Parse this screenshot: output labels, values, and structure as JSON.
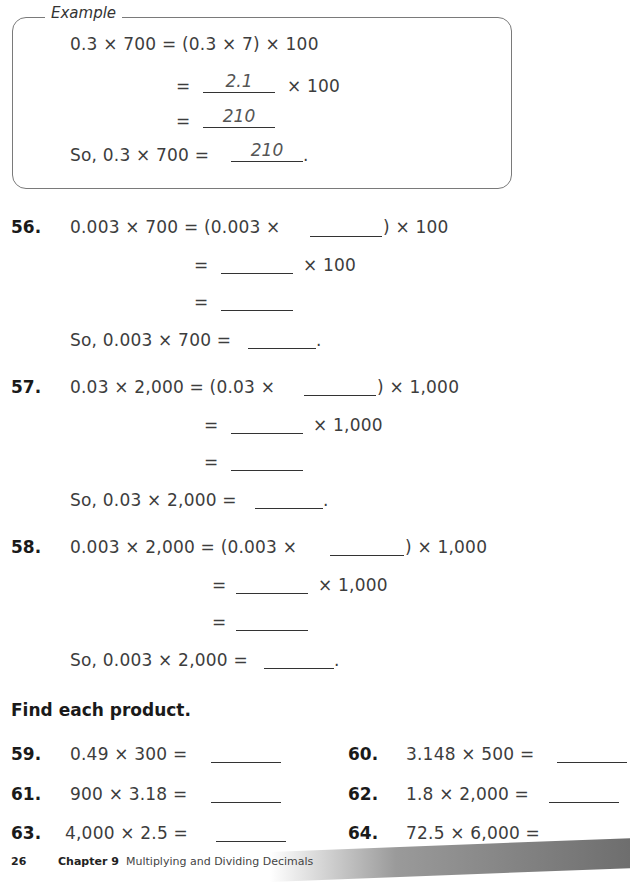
{
  "example": {
    "label": "Example",
    "line1": "0.3 × 700 = (0.3 × 7) × 100",
    "line2_eq": "=",
    "line2_answer": "2.1",
    "line2_suffix": "× 100",
    "line3_eq": "=",
    "line3_answer": "210",
    "line4_prefix": "So, 0.3 × 700 =",
    "line4_answer": "210",
    "line4_suffix": "."
  },
  "problems_steps": [
    {
      "number": "56.",
      "line1_left": "0.003 × 700 = (0.003 ×",
      "line1_right": ") × 100",
      "line2_eq": "=",
      "line2_suffix": "× 100",
      "line3_eq": "=",
      "line4_prefix": "So, 0.003 × 700 =",
      "line4_suffix": "."
    },
    {
      "number": "57.",
      "line1_left": "0.03 × 2,000 = (0.03 ×",
      "line1_right": ") × 1,000",
      "line2_eq": "=",
      "line2_suffix": "× 1,000",
      "line3_eq": "=",
      "line4_prefix": "So, 0.03 × 2,000 =",
      "line4_suffix": "."
    },
    {
      "number": "58.",
      "line1_left": "0.003 × 2,000 = (0.003 ×",
      "line1_right": ") × 1,000",
      "line2_eq": "=",
      "line2_suffix": "× 1,000",
      "line3_eq": "=",
      "line4_prefix": "So, 0.003 × 2,000 =",
      "line4_suffix": "."
    }
  ],
  "section_heading": "Find each product.",
  "products": [
    {
      "number": "59.",
      "expr": "0.49 × 300 ="
    },
    {
      "number": "60.",
      "expr": "3.148 × 500 ="
    },
    {
      "number": "61.",
      "expr": "900 × 3.18 ="
    },
    {
      "number": "62.",
      "expr": "1.8 × 2,000 ="
    },
    {
      "number": "63.",
      "expr": "4,000 × 2.5 ="
    },
    {
      "number": "64.",
      "expr": "72.5 × 6,000 ="
    }
  ],
  "footer": {
    "page_number": "26",
    "chapter": "Chapter 9",
    "chapter_title": "Multiplying and Dividing Decimals"
  }
}
